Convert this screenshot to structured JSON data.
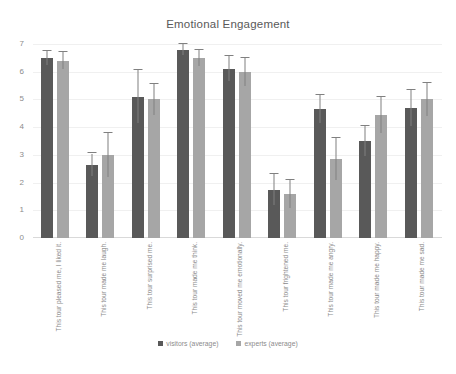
{
  "chart_data": {
    "type": "bar",
    "title": "Emotional Engagement",
    "xlabel": "",
    "ylabel": "",
    "ylim": [
      0,
      7
    ],
    "yticks": [
      0,
      1,
      2,
      3,
      4,
      5,
      6,
      7
    ],
    "grid": false,
    "legend_position": "bottom",
    "categories": [
      "This tour pleased me, I liked it.",
      "This tour made me laugh.",
      "This tour surprised me.",
      "This tour made me think.",
      "This tour moved me emotionally.",
      "This tour frightened me.",
      "This tour made me angry.",
      "This tour made me happy.",
      "This tour made me sad."
    ],
    "series": [
      {
        "name": "visitors (average)",
        "color": "#595959",
        "values": [
          6.5,
          2.65,
          5.1,
          6.8,
          6.1,
          1.75,
          4.65,
          3.5,
          4.7
        ],
        "errors": [
          0.25,
          0.4,
          0.95,
          0.2,
          0.45,
          0.55,
          0.5,
          0.55,
          0.65
        ]
      },
      {
        "name": "experts (average)",
        "color": "#a6a6a6",
        "values": [
          6.4,
          3.0,
          5.0,
          6.5,
          6.0,
          1.6,
          2.85,
          4.45,
          5.0
        ],
        "errors": [
          0.3,
          0.8,
          0.55,
          0.3,
          0.5,
          0.5,
          0.75,
          0.65,
          0.6
        ]
      }
    ]
  },
  "legend": {
    "items": [
      {
        "label": "visitors (average)",
        "color": "#595959"
      },
      {
        "label": "experts (average)",
        "color": "#a6a6a6"
      }
    ]
  },
  "colors": {
    "series_visitors": "#595959",
    "series_experts": "#a6a6a6",
    "text": "#8c8c8c",
    "title_text": "#595959",
    "axis": "#d9d9d9",
    "background": "#ffffff"
  }
}
